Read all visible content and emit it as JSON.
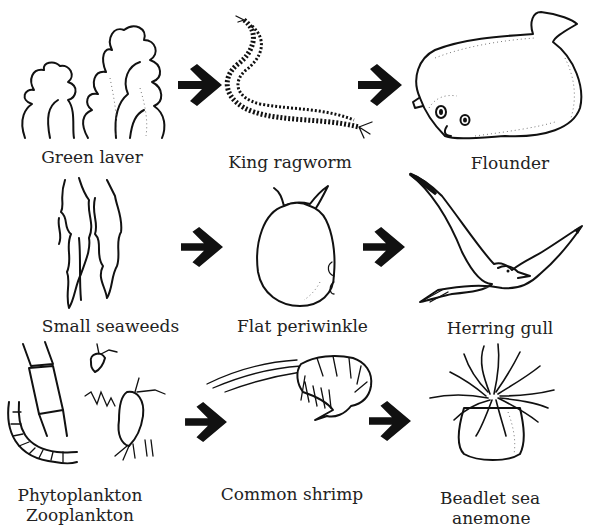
{
  "diagram": {
    "type": "food-chains",
    "arrow_color": "#111111",
    "rows": [
      {
        "organisms": [
          {
            "id": "green-laver",
            "label": "Green laver",
            "icon": "seaweed-leafy-icon"
          },
          {
            "id": "king-ragworm",
            "label": "King ragworm",
            "icon": "worm-icon"
          },
          {
            "id": "flounder",
            "label": "Flounder",
            "icon": "flatfish-icon"
          }
        ]
      },
      {
        "organisms": [
          {
            "id": "small-seaweeds",
            "label": "Small seaweeds",
            "icon": "seaweed-fronds-icon"
          },
          {
            "id": "flat-periwinkle",
            "label": "Flat periwinkle",
            "icon": "snail-icon"
          },
          {
            "id": "herring-gull",
            "label": "Herring gull",
            "icon": "gull-icon"
          }
        ]
      },
      {
        "organisms": [
          {
            "id": "plankton",
            "label": "Phytoplankton",
            "label_line2": "Zooplankton",
            "icon": "plankton-icon"
          },
          {
            "id": "common-shrimp",
            "label": "Common shrimp",
            "icon": "shrimp-icon"
          },
          {
            "id": "beadlet-anemone",
            "label": "Beadlet sea",
            "label_line2": "anemone",
            "icon": "anemone-icon"
          }
        ]
      }
    ],
    "edges": [
      {
        "from": "green-laver",
        "to": "king-ragworm"
      },
      {
        "from": "king-ragworm",
        "to": "flounder"
      },
      {
        "from": "small-seaweeds",
        "to": "flat-periwinkle"
      },
      {
        "from": "flat-periwinkle",
        "to": "herring-gull"
      },
      {
        "from": "plankton",
        "to": "common-shrimp"
      },
      {
        "from": "common-shrimp",
        "to": "beadlet-anemone"
      }
    ]
  }
}
